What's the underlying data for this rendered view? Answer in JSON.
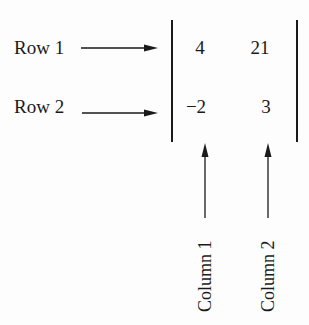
{
  "diagram": {
    "type": "matrix-annotation",
    "rows": [
      {
        "label": "Row 1",
        "values": [
          "4",
          "21"
        ]
      },
      {
        "label": "Row 2",
        "values": [
          "−2",
          "3"
        ]
      }
    ],
    "columns": [
      {
        "label": "Column 1"
      },
      {
        "label": "Column 2"
      }
    ],
    "colors": {
      "ink": "#1a1a1a",
      "background": "#fdfdfd"
    }
  }
}
